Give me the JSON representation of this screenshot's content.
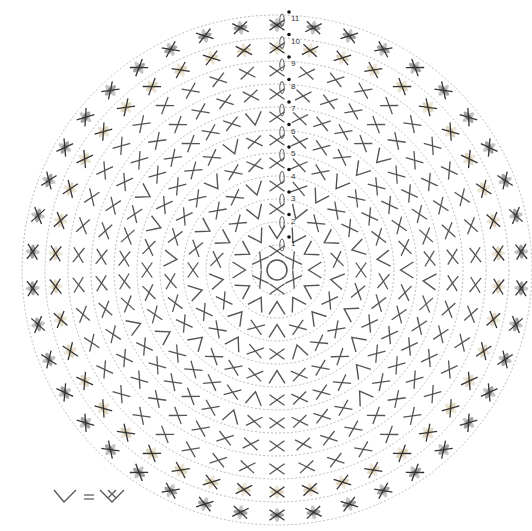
{
  "chart_data": {
    "type": "diagram",
    "center": [
      277,
      270
    ],
    "ring_spacing": 23,
    "center_symbol": "magic-ring",
    "colors": {
      "stitch": "#555555",
      "guide": "#bbbbbb",
      "row10": "#c9b58a",
      "row11": "#555555",
      "marker": "#111111"
    },
    "rows": [
      {
        "row": 1,
        "count": 6,
        "pattern": "sc"
      },
      {
        "row": 2,
        "count": 12,
        "pattern": "inc"
      },
      {
        "row": 3,
        "count": 18,
        "pattern": "sc,inc"
      },
      {
        "row": 4,
        "count": 24,
        "pattern": "sc,sc,inc"
      },
      {
        "row": 5,
        "count": 30,
        "pattern": "sc,sc,sc,inc"
      },
      {
        "row": 6,
        "count": 36,
        "pattern": "sc,sc,sc,sc,inc"
      },
      {
        "row": 7,
        "count": 42,
        "pattern": "sc,sc,sc,sc,sc,inc"
      },
      {
        "row": 8,
        "count": 42,
        "pattern": "sc"
      },
      {
        "row": 9,
        "count": 42,
        "pattern": "sc"
      },
      {
        "row": 10,
        "count": 42,
        "pattern": "sc",
        "color": "tan"
      },
      {
        "row": 11,
        "count": 42,
        "pattern": "sc",
        "color": "dark"
      }
    ],
    "row_labels": [
      "1",
      "2",
      "3",
      "4",
      "5",
      "6",
      "7",
      "8",
      "9",
      "10",
      "11"
    ]
  },
  "legend": {
    "lhs": "V",
    "equals": "=",
    "rhs": "2 sc in same st",
    "description": "increase = two single crochets in same stitch"
  }
}
